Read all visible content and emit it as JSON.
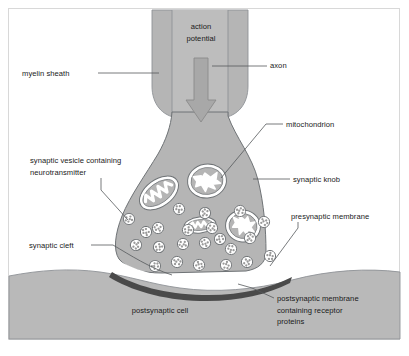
{
  "figure": {
    "type": "labelled-biological-diagram",
    "background_color": "#ffffff",
    "frame_color": "#d8d8d8"
  },
  "colors": {
    "cell_fill": "#b5b5b5",
    "cell_fill_light": "#bdbdbd",
    "postsynaptic_fill": "#b9b9b9",
    "outline": "#6f7376",
    "arrow_fill": "#a3a3a3",
    "arrow_outline": "#8a8a8a",
    "vesicle_fill": "#ffffff",
    "vesicle_dot": "#9a9a9a",
    "mitochondrion_fill": "#ffffff",
    "cleft_fill": "#ffffff",
    "postsynaptic_membrane": "#4a4a4a",
    "label_text": "#1a1a1a",
    "leader_line": "#55595c"
  },
  "labels": [
    {
      "id": "action-potential",
      "lines": [
        "action",
        "potential"
      ],
      "x": 201,
      "y": 29,
      "anchor": "middle",
      "has_leader": false
    },
    {
      "id": "axon",
      "lines": [
        "axon"
      ],
      "x": 270,
      "y": 68,
      "anchor": "start",
      "has_leader": true
    },
    {
      "id": "myelin-sheath",
      "lines": [
        "myelin sheath"
      ],
      "x": 22,
      "y": 76,
      "anchor": "start",
      "has_leader": true
    },
    {
      "id": "mitochondrion",
      "lines": [
        "mitochondrion"
      ],
      "x": 286,
      "y": 127,
      "anchor": "start",
      "has_leader": true
    },
    {
      "id": "synaptic-vesicle",
      "lines": [
        "synaptic vesicle containing",
        "neurotransmitter"
      ],
      "x": 30,
      "y": 163,
      "anchor": "start",
      "has_leader": true
    },
    {
      "id": "synaptic-knob",
      "lines": [
        "synaptic knob"
      ],
      "x": 293,
      "y": 182,
      "anchor": "start",
      "has_leader": true
    },
    {
      "id": "presynaptic-membrane",
      "lines": [
        "presynaptic membrane"
      ],
      "x": 291,
      "y": 219,
      "anchor": "start",
      "has_leader": true
    },
    {
      "id": "synaptic-cleft",
      "lines": [
        "synaptic cleft"
      ],
      "x": 29,
      "y": 248,
      "anchor": "start",
      "has_leader": true
    },
    {
      "id": "postsynaptic-cell",
      "lines": [
        "postsynaptic cell"
      ],
      "x": 160,
      "y": 313,
      "anchor": "middle",
      "has_leader": false
    },
    {
      "id": "postsynaptic-membrane",
      "lines": [
        "postsynaptic membrane",
        "containing receptor",
        "proteins"
      ],
      "x": 277,
      "y": 301,
      "anchor": "start",
      "has_leader": true
    }
  ],
  "structures": {
    "myelin_sheath": "outer rounded sheath column around axon",
    "axon": "inner channel running down the centre of the sheath",
    "synaptic_knob": "bulbous terminal of the axon",
    "mitochondria_count": 4,
    "vesicle_count": 22,
    "action_potential_arrow": "downward arrow inside axon",
    "synaptic_cleft": "white gap between knob and postsynaptic cell",
    "postsynaptic_cell": "large grey band across the bottom"
  },
  "vesicles": [
    {
      "cx": 129,
      "cy": 219
    },
    {
      "cx": 158,
      "cy": 228
    },
    {
      "cx": 179,
      "cy": 209
    },
    {
      "cx": 205,
      "cy": 213
    },
    {
      "cx": 220,
      "cy": 239
    },
    {
      "cx": 240,
      "cy": 211
    },
    {
      "cx": 264,
      "cy": 222
    },
    {
      "cx": 270,
      "cy": 256
    },
    {
      "cx": 136,
      "cy": 245
    },
    {
      "cx": 159,
      "cy": 247
    },
    {
      "cx": 183,
      "cy": 244
    },
    {
      "cx": 205,
      "cy": 243
    },
    {
      "cx": 231,
      "cy": 249
    },
    {
      "cx": 250,
      "cy": 238
    },
    {
      "cx": 155,
      "cy": 266
    },
    {
      "cx": 177,
      "cy": 262
    },
    {
      "cx": 199,
      "cy": 265
    },
    {
      "cx": 226,
      "cy": 265
    },
    {
      "cx": 247,
      "cy": 262
    },
    {
      "cx": 188,
      "cy": 230
    },
    {
      "cx": 212,
      "cy": 228
    },
    {
      "cx": 146,
      "cy": 232
    }
  ],
  "mitochondria": [
    {
      "cx": 159,
      "cy": 193,
      "rx": 22,
      "ry": 14,
      "rot": -36
    },
    {
      "cx": 207,
      "cy": 181,
      "rx": 19,
      "ry": 17,
      "rot": -8
    },
    {
      "cx": 200,
      "cy": 225,
      "rx": 16,
      "ry": 8,
      "rot": -6
    },
    {
      "cx": 243,
      "cy": 226,
      "rx": 17,
      "ry": 16,
      "rot": 10
    }
  ]
}
